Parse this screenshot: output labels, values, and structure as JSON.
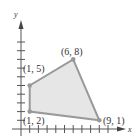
{
  "diagram": {
    "axis_labels": {
      "x": "x",
      "y": "y"
    },
    "vertices": [
      {
        "label": "(1, 2)",
        "x": 1,
        "y": 2
      },
      {
        "label": "(1, 5)",
        "x": 1,
        "y": 5
      },
      {
        "label": "(6, 8)",
        "x": 6,
        "y": 8
      },
      {
        "label": "(9, 1)",
        "x": 9,
        "y": 1
      }
    ],
    "colors": {
      "fill": "#e6e6e6",
      "edge": "#999999",
      "axis": "#555555"
    }
  }
}
